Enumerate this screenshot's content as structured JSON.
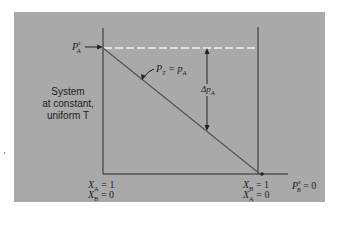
{
  "diagram": {
    "system_label": [
      "System",
      "at constant,",
      "uniform T"
    ],
    "left_top_label": {
      "main": "P",
      "sup": "s",
      "sub": "A"
    },
    "curve_label": {
      "left": "P",
      "left_sub": "T",
      "eq": " = ",
      "right": "p",
      "right_sub": "A"
    },
    "delta_label": {
      "main": "Δp",
      "sub": "A"
    },
    "left_bottom": [
      {
        "var": "X",
        "sub": "A",
        "val": " = 1"
      },
      {
        "var": "X",
        "sub": "B",
        "val": " = 0"
      }
    ],
    "right_bottom": [
      {
        "var": "X",
        "sub": "B",
        "val": " = 1"
      },
      {
        "var": "X",
        "sub": "A",
        "val": " = 0"
      }
    ],
    "right_end_label": {
      "main": "P",
      "sup": "s",
      "sub": "B",
      "val": " = 0"
    },
    "colors": {
      "panel": "#a9a9a9",
      "line": "#2a2a2a",
      "dashed": "#f2f2f2",
      "diagonal": "#555555"
    }
  }
}
